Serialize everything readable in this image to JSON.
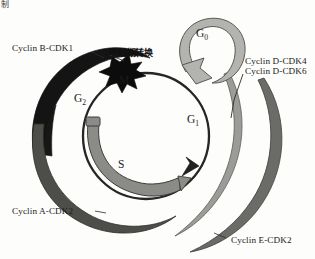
{
  "figure": {
    "type": "cell-cycle-diagram",
    "corner_fragment": "制",
    "background_color": "#fdfdfc"
  },
  "phases": [
    {
      "key": "g1",
      "label": "G",
      "sub": "1",
      "name": "G1 phase"
    },
    {
      "key": "s",
      "label": "S",
      "sub": "",
      "name": "S phase"
    },
    {
      "key": "g2",
      "label": "G",
      "sub": "2",
      "name": "G2 phase"
    },
    {
      "key": "m",
      "label": "M",
      "sub": "",
      "name": "M phase"
    },
    {
      "key": "g0",
      "label": "G",
      "sub": "0",
      "name": "G0 quiescent phase"
    }
  ],
  "checkpoint": {
    "label": "中后期转换",
    "meaning": "metaphase-anaphase transition"
  },
  "complexes": [
    {
      "key": "cyclin_b",
      "label": "Cyclin B-CDK1",
      "color": "#1a1a1a",
      "position": "upper-left"
    },
    {
      "key": "cyclin_d",
      "line1": "Cyclin D-CDK4",
      "line2": "Cyclin D-CDK6",
      "color": "#9a9a96",
      "position": "right"
    },
    {
      "key": "cyclin_a",
      "label": "Cyclin A-CDK2",
      "color": "#4a4a48",
      "position": "lower-left"
    },
    {
      "key": "cyclin_e",
      "label": "Cyclin E-CDK2",
      "color": "#6e6e6a",
      "position": "lower-right"
    }
  ],
  "colors": {
    "cycle_ring": "#2a2a2a",
    "s_band": "#8a8a86",
    "g0_ring": "#b0b0ac",
    "splat": "#0d0d0d",
    "leader_line": "#2b2b2b"
  }
}
